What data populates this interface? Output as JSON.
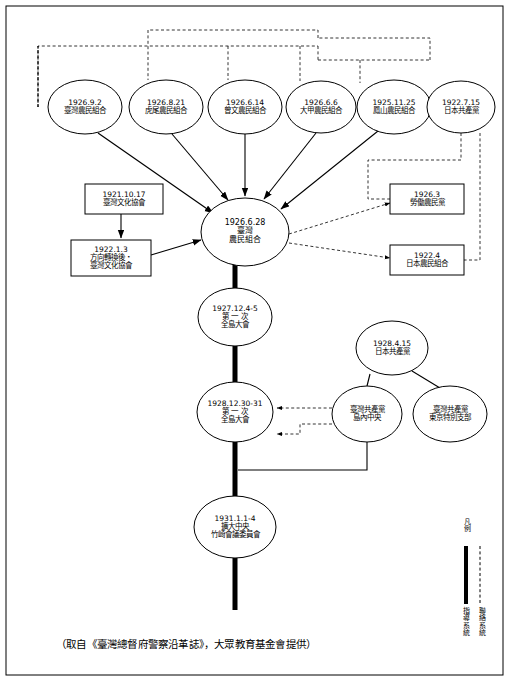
{
  "diagram": {
    "type": "organization-flow-chart",
    "ellipse_nodes": [
      {
        "id": "n1926_9_2",
        "lines": "1926.9.2\n臺灣農民組合",
        "cx": 85,
        "cy": 107,
        "rx": 37,
        "ry": 27,
        "font": 7.5
      },
      {
        "id": "n1926_8_21",
        "lines": "1926.8.21\n虎尾農民組合",
        "cx": 166,
        "cy": 107,
        "rx": 37,
        "ry": 27,
        "font": 7.5
      },
      {
        "id": "n1926_6_14",
        "lines": "1926.6.14\n曾文農民組合",
        "cx": 245,
        "cy": 107,
        "rx": 37,
        "ry": 27,
        "font": 7.5
      },
      {
        "id": "n1926_6_6",
        "lines": "1926.6.6\n大甲農民組合",
        "cx": 321,
        "cy": 107,
        "rx": 35,
        "ry": 26,
        "font": 7.5
      },
      {
        "id": "n1925_11_25",
        "lines": "1925.11.25\n鳳山農民組合",
        "cx": 394,
        "cy": 107,
        "rx": 37,
        "ry": 27,
        "font": 7.5
      },
      {
        "id": "n1922_7_15",
        "lines": "1922.7.15\n日本共產黨",
        "cx": 461,
        "cy": 107,
        "rx": 34,
        "ry": 26,
        "font": 7.5
      },
      {
        "id": "n1926_6_28",
        "lines": "1926.6.28\n臺灣\n農民組合",
        "cx": 245,
        "cy": 232,
        "rx": 44,
        "ry": 34,
        "font": 8
      },
      {
        "id": "n1927_12_4",
        "lines": "1927.12.4-5\n第 一 次\n全島大會",
        "cx": 235,
        "cy": 317,
        "rx": 37,
        "ry": 29,
        "font": 7.5
      },
      {
        "id": "n1928_12_30",
        "lines": "1928.12.30-31\n第 一 次\n全島大會",
        "cx": 235,
        "cy": 412,
        "rx": 38,
        "ry": 30,
        "font": 7.5
      },
      {
        "id": "n1931_1_1",
        "lines": "1931.1.1-4\n擴大中央\n竹崎會議委員會",
        "cx": 235,
        "cy": 527,
        "rx": 41,
        "ry": 31,
        "font": 7.5
      },
      {
        "id": "n1928_4_15",
        "lines": "1928.4.15\n日本共產黨",
        "cx": 392,
        "cy": 348,
        "rx": 36,
        "ry": 27,
        "font": 7.5
      },
      {
        "id": "n_taiwan_cp_island",
        "lines": "臺灣共產黨\n島內中央",
        "cx": 367,
        "cy": 414,
        "rx": 35,
        "ry": 28,
        "font": 7.5
      },
      {
        "id": "n_taiwan_cp_tokyo",
        "lines": "臺灣共產黨\n東京特別支部",
        "cx": 450,
        "cy": 414,
        "rx": 37,
        "ry": 28,
        "font": 7.5
      }
    ],
    "box_nodes": [
      {
        "id": "b1921_10_17",
        "lines": "1921.10.17\n臺灣文化協會",
        "x": 85,
        "y": 184,
        "w": 78,
        "h": 30,
        "font": 7.5
      },
      {
        "id": "b1922_1_3",
        "lines": "1922.1.3\n方向轉換後・\n臺灣文化協會",
        "x": 71,
        "y": 240,
        "w": 80,
        "h": 36,
        "font": 7.5
      },
      {
        "id": "b1926_3",
        "lines": "1926.3\n勞働農民黨",
        "x": 390,
        "y": 184,
        "w": 74,
        "h": 30,
        "font": 7.5
      },
      {
        "id": "b1922_4",
        "lines": "1922.4\n日本農民組合",
        "x": 390,
        "y": 245,
        "w": 74,
        "h": 30,
        "font": 7.5
      }
    ],
    "legend": {
      "title": "凡\n例",
      "items": [
        {
          "id": "legend-solid",
          "label": "指\n導\n系\n統",
          "style": "solid"
        },
        {
          "id": "legend-dashed",
          "label": "聯\n絡\n系\n統",
          "style": "dashed"
        }
      ]
    },
    "caption": "（取自《臺灣總督府警察沿革誌》，大眾教育基金會提供）"
  }
}
